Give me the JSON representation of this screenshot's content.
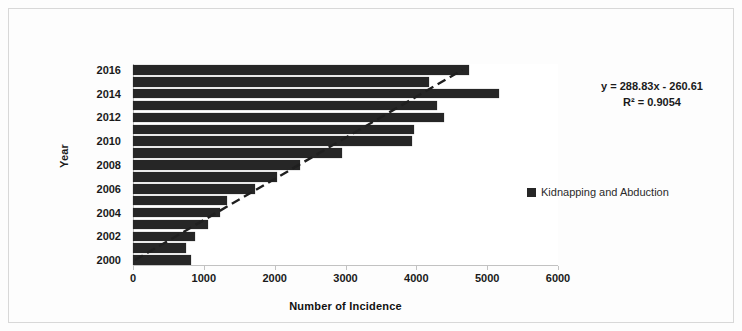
{
  "chart_data": {
    "type": "bar",
    "orientation": "horizontal",
    "title": "",
    "xlabel": "Number of Incidence",
    "ylabel": "Year",
    "xlim": [
      0,
      6000
    ],
    "xticks": [
      "0",
      "1000",
      "2000",
      "3000",
      "4000",
      "5000",
      "6000"
    ],
    "xtick_values": [
      0,
      1000,
      2000,
      3000,
      4000,
      5000,
      6000
    ],
    "grid": false,
    "legend_position": "right",
    "categories": [
      "2000",
      "2001",
      "2002",
      "2003",
      "2004",
      "2005",
      "2006",
      "2007",
      "2008",
      "2009",
      "2010",
      "2011",
      "2012",
      "2013",
      "2014",
      "2015",
      "2016"
    ],
    "ytick_labels": [
      "2000",
      "2002",
      "2004",
      "2006",
      "2008",
      "2010",
      "2012",
      "2014",
      "2016"
    ],
    "series": [
      {
        "name": "Kidnapping and Abduction",
        "color": "#262626",
        "values": [
          825,
          755,
          875,
          1060,
          1225,
          1320,
          1720,
          2030,
          2360,
          2950,
          3940,
          3960,
          4385,
          4290,
          5165,
          4175,
          4740
        ]
      }
    ],
    "trendline": {
      "type": "linear-dashed",
      "equation": "y = 288.83x - 260.61",
      "r_squared_label": "R² = 0.9054",
      "slope": 288.83,
      "intercept": -260.61,
      "r_squared": 0.9054,
      "color": "#1f1f1f"
    }
  },
  "annotations": {
    "equation_line1": "y = 288.83x - 260.61",
    "equation_line2": "R² = 0.9054"
  },
  "legend": {
    "entries": [
      {
        "label": "Kidnapping and Abduction",
        "color": "#262626"
      }
    ]
  },
  "axes": {
    "x_title": "Number of Incidence",
    "y_title": "Year"
  }
}
